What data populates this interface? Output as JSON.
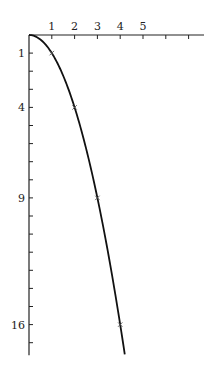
{
  "chart_data": {
    "type": "line",
    "title": "",
    "xlabel": "",
    "ylabel": "",
    "x_axis_position": "top",
    "y_axis_inverted": true,
    "xlim": [
      0,
      7.6
    ],
    "ylim": [
      0,
      17.7
    ],
    "x_ticks": [
      1,
      2,
      3,
      4,
      5,
      6,
      7
    ],
    "x_tick_labels": [
      "1",
      "2",
      "3",
      "4",
      "5",
      "",
      ""
    ],
    "y_ticks": [
      1,
      2,
      3,
      4,
      5,
      6,
      7,
      8,
      9,
      10,
      11,
      12,
      13,
      14,
      15,
      16,
      17
    ],
    "y_tick_labels": {
      "1": "1",
      "4": "4",
      "9": "9",
      "16": "16"
    },
    "grid": false,
    "series": [
      {
        "name": "y = x^2",
        "x": [
          0,
          0.5,
          1,
          1.5,
          2,
          2.5,
          3,
          3.5,
          4,
          4.2
        ],
        "values": [
          0,
          0.25,
          1,
          2.25,
          4,
          6.25,
          9,
          12.25,
          16,
          17.64
        ]
      }
    ],
    "marked_points": [
      {
        "x": 1,
        "y": 1,
        "marker": "×"
      },
      {
        "x": 2,
        "y": 4,
        "marker": "×"
      },
      {
        "x": 3,
        "y": 9,
        "marker": "×"
      },
      {
        "x": 4,
        "y": 16,
        "marker": "×"
      }
    ]
  }
}
